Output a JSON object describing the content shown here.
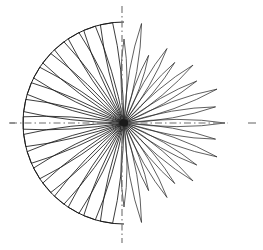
{
  "figure": {
    "background_color": "#ffffff",
    "line_color": "#1a1a1a",
    "axis_color": "#6f6f6f"
  },
  "geometry": {
    "center_x": 124,
    "center_y": 123,
    "boundary_radius": 101,
    "lobe_count": 36,
    "angular_step_degrees": 10,
    "half_width_degrees": 2.6,
    "canvas_width": 263,
    "canvas_height": 250
  },
  "axes": {
    "horizontal": {
      "label": "horizontal-reference-axis",
      "style": "dash-dot",
      "x_start": 10,
      "x_end": 256,
      "y": 123
    },
    "vertical": {
      "label": "vertical-reference-axis",
      "style": "dash-dot",
      "y_start": 6,
      "y_end": 243,
      "x": 122
    }
  },
  "chart_data": {
    "type": "line",
    "subtitle": "",
    "xlabel": "",
    "ylabel": "",
    "legend": [],
    "annotations": [],
    "grid": false,
    "coordinate_system": "polar",
    "angle_unit": "degrees",
    "radius_unit": "pixels",
    "boundary_circle_radius": 101,
    "angles": [
      0,
      10,
      20,
      30,
      40,
      50,
      60,
      70,
      80,
      90,
      100,
      110,
      120,
      130,
      140,
      150,
      160,
      170,
      180,
      190,
      200,
      210,
      220,
      230,
      240,
      250,
      260,
      270,
      280,
      290,
      300,
      310,
      320,
      330,
      340,
      350
    ],
    "radii": [
      101,
      93,
      99,
      84,
      90,
      79,
      86,
      72,
      101,
      84,
      101,
      101,
      101,
      101,
      101,
      101,
      101,
      101,
      101,
      101,
      101,
      101,
      101,
      101,
      101,
      101,
      101,
      84,
      101,
      72,
      86,
      79,
      90,
      84,
      99,
      93
    ],
    "left_half_clipped": true,
    "right_half_clipped": false,
    "ylim": [
      0,
      101
    ]
  }
}
